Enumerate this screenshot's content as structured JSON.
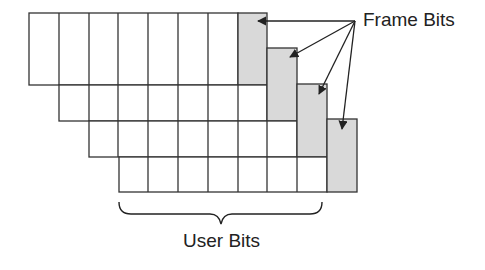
{
  "labels": {
    "frame_bits": "Frame Bits",
    "user_bits": "User Bits"
  },
  "colors": {
    "stroke": "#333333",
    "frame_fill": "#d9d9d9",
    "cell_fill": "#ffffff",
    "text": "#222222"
  },
  "grid": {
    "rows": 4,
    "user_bits_per_row": 7,
    "frame_bits_per_row": 1,
    "cell_width": 29.8,
    "rows_geometry": [
      {
        "row": 1,
        "x": 29,
        "top": 13,
        "bottom": 85
      },
      {
        "row": 2,
        "x": 59,
        "top": 85,
        "bottom": 121,
        "frame_top": 48
      },
      {
        "row": 3,
        "x": 89,
        "top": 121,
        "bottom": 157,
        "frame_top": 84
      },
      {
        "row": 4,
        "x": 119,
        "top": 157,
        "bottom": 192,
        "frame_top": 119
      }
    ]
  }
}
